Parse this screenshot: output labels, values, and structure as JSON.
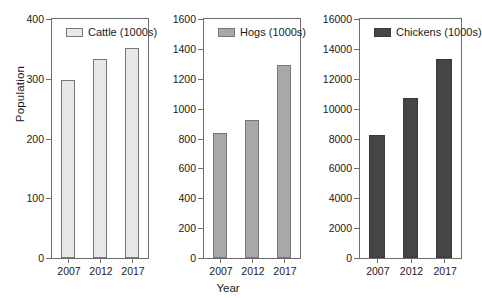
{
  "figure": {
    "ylabel": "Population",
    "xlabel": "Year"
  },
  "chart_data": [
    {
      "type": "bar",
      "title": "Cattle (1000s)",
      "legend_label": "Cattle (1000s)",
      "legend_position": "inside top-left",
      "xlabel": "",
      "ylabel": "Population",
      "categories": [
        "2007",
        "2012",
        "2017"
      ],
      "values": [
        298,
        333,
        352
      ],
      "ylim": [
        0,
        400
      ],
      "yticks": [
        0,
        100,
        200,
        300,
        400
      ],
      "ytick_labels": [
        "0",
        "100",
        "200",
        "300",
        "400"
      ],
      "grid": false,
      "bar_color": "#e8e8e8",
      "bar_edge_color": "#777777"
    },
    {
      "type": "bar",
      "title": "Hogs (1000s)",
      "legend_label": "Hogs (1000s)",
      "legend_position": "inside top-left",
      "xlabel": "Year",
      "ylabel": "",
      "categories": [
        "2007",
        "2012",
        "2017"
      ],
      "values": [
        838,
        925,
        1293
      ],
      "ylim": [
        0,
        1600
      ],
      "yticks": [
        0,
        200,
        400,
        600,
        800,
        1000,
        1200,
        1400,
        1600
      ],
      "ytick_labels": [
        "0",
        "200",
        "400",
        "600",
        "800",
        "1000",
        "1200",
        "1400",
        "1600"
      ],
      "grid": false,
      "bar_color": "#a8a8a8",
      "bar_edge_color": "#777777"
    },
    {
      "type": "bar",
      "title": "Chickens (1000s)",
      "legend_label": "Chickens (1000s)",
      "legend_position": "inside top-left",
      "xlabel": "",
      "ylabel": "",
      "categories": [
        "2007",
        "2012",
        "2017"
      ],
      "values": [
        8250,
        10700,
        13300
      ],
      "ylim": [
        0,
        16000
      ],
      "yticks": [
        0,
        2000,
        4000,
        6000,
        8000,
        10000,
        12000,
        14000,
        16000
      ],
      "ytick_labels": [
        "0",
        "2000",
        "4000",
        "6000",
        "8000",
        "10000",
        "12000",
        "14000",
        "16000"
      ],
      "grid": false,
      "bar_color": "#454545",
      "bar_edge_color": "#3a3a3a"
    }
  ]
}
